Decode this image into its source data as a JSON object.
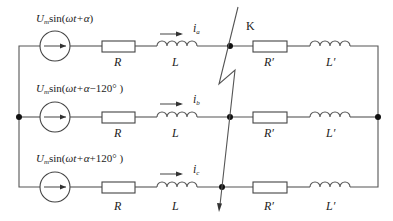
{
  "diagram": {
    "type": "three-phase-circuit",
    "fault_label": "K",
    "phases": [
      {
        "id": "a",
        "source": {
          "amp": "U",
          "amp_sub": "m",
          "func": "sin(",
          "arg": "ωt+α",
          "shift": "",
          "close": ")"
        },
        "current": {
          "sym": "i",
          "sub": "a"
        },
        "R": "R",
        "L": "L",
        "R2": "R′",
        "L2": "L′"
      },
      {
        "id": "b",
        "source": {
          "amp": "U",
          "amp_sub": "m",
          "func": "sin(",
          "arg": "ωt+α",
          "shift": "−120°",
          "close": " )"
        },
        "current": {
          "sym": "i",
          "sub": "b"
        },
        "R": "R",
        "L": "L",
        "R2": "R′",
        "L2": "L′"
      },
      {
        "id": "c",
        "source": {
          "amp": "U",
          "amp_sub": "m",
          "func": "sin(",
          "arg": "ωt+α",
          "shift": "+120°",
          "close": " )"
        },
        "current": {
          "sym": "i",
          "sub": "c"
        },
        "R": "R",
        "L": "L",
        "R2": "R′",
        "L2": "L′"
      }
    ],
    "colors": {
      "wire": "#555555",
      "node": "#111111",
      "text": "#222222"
    }
  }
}
